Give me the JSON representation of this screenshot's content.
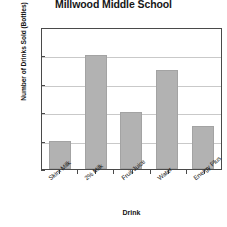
{
  "chart_data": {
    "type": "bar",
    "title": "Millwood Middle School",
    "title_line1": "",
    "title_line2": "Millwood Middle School",
    "categories": [
      "Skim Milk",
      "2% Milk",
      "Fruit Juice",
      "Water",
      "Energy Plus"
    ],
    "values": [
      100,
      400,
      200,
      350,
      150
    ],
    "xlabel": "Drink",
    "ylabel": "Number of Drinks Sold (Bottles)",
    "ylim": [
      0,
      500
    ],
    "yticks": [
      0,
      100,
      200,
      300,
      400,
      500
    ],
    "ytick_labels": [
      "0",
      "100",
      "200",
      "300",
      "400",
      "500"
    ],
    "grid": true,
    "legend": false,
    "bar_color": "#b2b2b2",
    "axis_color": "#4a4a4a",
    "grid_color": "#c9c9c9"
  }
}
